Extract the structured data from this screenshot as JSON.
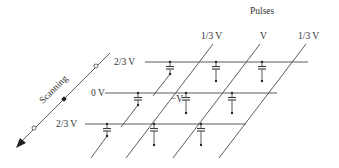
{
  "diagram": {
    "title": "Pulses",
    "scan_label": "Scanning",
    "column_labels": [
      "1/3 V",
      "V",
      "1/3 V"
    ],
    "row_labels": [
      "2/3 V",
      "0 V",
      "2/3 V"
    ],
    "cell_annotation": "−V",
    "colors": {
      "line": "#4a4a4a",
      "text": "#333333",
      "background": "#ffffff"
    }
  }
}
